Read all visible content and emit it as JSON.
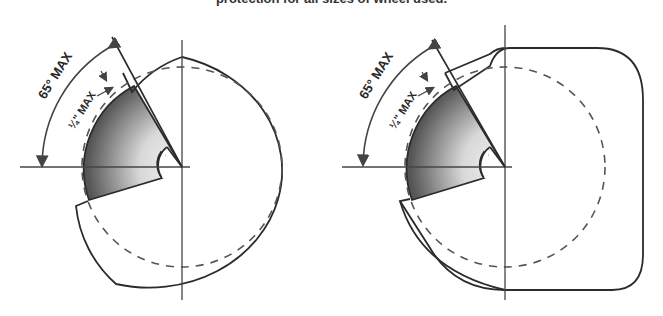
{
  "caption": "protection for all sizes of wheel used.",
  "diagrams": [
    {
      "name": "round-guard",
      "angle_label": "65° MAX",
      "gap_label": "¼\" MAX"
    },
    {
      "name": "square-guard",
      "angle_label": "65° MAX",
      "gap_label": "¼\" MAX"
    }
  ],
  "colors": {
    "line": "#2b2b2b",
    "dashed": "#555555",
    "wheel_dark": "#5a5a5a",
    "wheel_light": "#f2f2f2"
  }
}
